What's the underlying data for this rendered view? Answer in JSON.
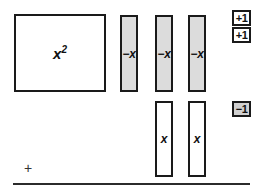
{
  "diagram": {
    "colors": {
      "tile_border": "#1a1a1a",
      "tile_white_fill": "#ffffff",
      "tile_gray_fill": "#dcdcdc",
      "unit_gray_fill": "#d0d0d0",
      "rule": "#2b2b2b",
      "text": "#111111"
    },
    "area_tile": {
      "base_label": "x",
      "exponent_label": "2",
      "full_label": "x2",
      "fill": "white"
    },
    "negative_x_tiles": [
      {
        "label": "−x",
        "fill": "gray"
      },
      {
        "label": "−x",
        "fill": "gray"
      },
      {
        "label": "−x",
        "fill": "gray"
      }
    ],
    "positive_x_tiles": [
      {
        "label": "x",
        "fill": "white"
      },
      {
        "label": "x",
        "fill": "white"
      }
    ],
    "unit_tiles": [
      {
        "label": "+1",
        "fill": "white"
      },
      {
        "label": "+1",
        "fill": "white"
      },
      {
        "label": "−1",
        "fill": "gray"
      }
    ],
    "operator": "+"
  }
}
